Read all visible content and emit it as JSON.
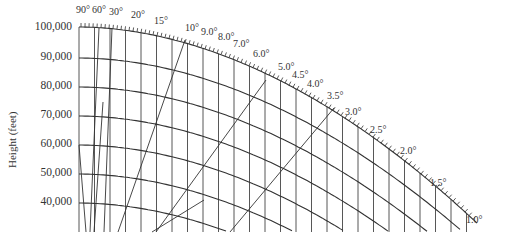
{
  "chart_data": {
    "type": "line",
    "title": "",
    "xlabel": "",
    "ylabel": "Height (feet)",
    "grid": true,
    "y_ticks": [
      "100,000",
      "90,000",
      "80,000",
      "70,000",
      "60,000",
      "50,000",
      "40,000"
    ],
    "y_values": [
      100000,
      90000,
      80000,
      70000,
      60000,
      50000,
      40000
    ],
    "ylim": [
      35000,
      100000
    ],
    "elevation_angle_labels": [
      "90°",
      "60°",
      "30°",
      "20°",
      "15°",
      "10°",
      "9.0°",
      "8.0°",
      "7.0°",
      "6.0°",
      "5.0°",
      "4.5°",
      "4.0°",
      "3.5°",
      "3.0°",
      "2.5°",
      "2.0°",
      "1.5°",
      "1.0°"
    ]
  },
  "axis": {
    "title": "Height (feet)",
    "ticks": [
      {
        "label": "100,000",
        "y": 28
      },
      {
        "label": "90,000",
        "y": 58
      },
      {
        "label": "80,000",
        "y": 87
      },
      {
        "label": "70,000",
        "y": 116
      },
      {
        "label": "60,000",
        "y": 145
      },
      {
        "label": "50,000",
        "y": 174
      },
      {
        "label": "40,000",
        "y": 203
      }
    ]
  },
  "angles": [
    {
      "label": "90°",
      "x": 76,
      "y": 11
    },
    {
      "label": "60°",
      "x": 92,
      "y": 11
    },
    {
      "label": "30°",
      "x": 109,
      "y": 13
    },
    {
      "label": "20°",
      "x": 131,
      "y": 16
    },
    {
      "label": "15°",
      "x": 154,
      "y": 22
    },
    {
      "label": "10°",
      "x": 185,
      "y": 29
    },
    {
      "label": "9.0°",
      "x": 201,
      "y": 33
    },
    {
      "label": "8.0°",
      "x": 218,
      "y": 38
    },
    {
      "label": "7.0°",
      "x": 233,
      "y": 45
    },
    {
      "label": "6.0°",
      "x": 253,
      "y": 55
    },
    {
      "label": "5.0°",
      "x": 278,
      "y": 68
    },
    {
      "label": "4.5°",
      "x": 292,
      "y": 76
    },
    {
      "label": "4.0°",
      "x": 307,
      "y": 85
    },
    {
      "label": "3.5°",
      "x": 327,
      "y": 97
    },
    {
      "label": "3.0°",
      "x": 345,
      "y": 113
    },
    {
      "label": "2.5°",
      "x": 370,
      "y": 131
    },
    {
      "label": "2.0°",
      "x": 400,
      "y": 152
    },
    {
      "label": "1.5°",
      "x": 430,
      "y": 184
    },
    {
      "label": "1.0°",
      "x": 466,
      "y": 221
    }
  ]
}
